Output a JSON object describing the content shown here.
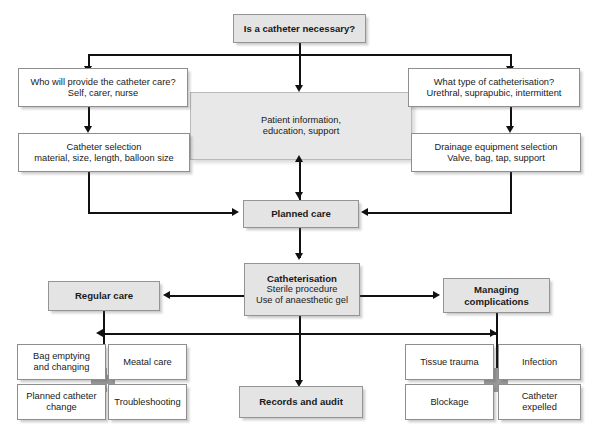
{
  "diagram": {
    "colors": {
      "line": "#111111",
      "box_fill_white": "#ffffff",
      "box_fill_grey": "#e4e4e4",
      "panel_fill": "#e8e8e8",
      "border": "#8e8e8e",
      "junction": "#9a9a9a"
    },
    "nodes": {
      "start": {
        "title": "Is a catheter necessary?"
      },
      "who_provides": {
        "line1": "Who will provide the catheter care?",
        "line2": "Self, carer, nurse"
      },
      "type_catheterisation": {
        "line1": "What type of catheterisation?",
        "line2": "Urethral, suprapubic, intermittent"
      },
      "patient_info": {
        "line1": "Patient information,",
        "line2": "education, support"
      },
      "catheter_selection": {
        "line1": "Catheter selection",
        "line2": "material, size, length, balloon size"
      },
      "drainage_selection": {
        "line1": "Drainage equipment selection",
        "line2": "Valve, bag, tap, support"
      },
      "planned_care": {
        "title": "Planned care"
      },
      "catheterisation": {
        "title": "Catheterisation",
        "line1": "Sterile procedure",
        "line2": "Use of anaesthetic gel"
      },
      "regular_care": {
        "title": "Regular care"
      },
      "managing_complications": {
        "line1": "Managing",
        "line2": "complications"
      },
      "records_audit": {
        "title": "Records and audit"
      },
      "bag_emptying": {
        "line1": "Bag emptying",
        "line2": "and changing"
      },
      "meatal_care": {
        "line1": "Meatal care"
      },
      "planned_catheter_change": {
        "line1": "Planned catheter",
        "line2": "change"
      },
      "troubleshooting": {
        "line1": "Troubleshooting"
      },
      "tissue_trauma": {
        "line1": "Tissue trauma"
      },
      "infection": {
        "line1": "Infection"
      },
      "blockage": {
        "line1": "Blockage"
      },
      "catheter_expelled": {
        "line1": "Catheter",
        "line2": "expelled"
      }
    }
  }
}
